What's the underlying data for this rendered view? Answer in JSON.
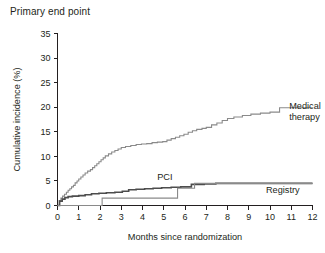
{
  "panel": {
    "title": "Primary end point"
  },
  "chart_data": {
    "type": "line",
    "title": "Primary end point",
    "xlabel": "Months since randomization",
    "ylabel": "Cumulative incidence (%)",
    "xlim": [
      0,
      12
    ],
    "ylim": [
      0,
      35
    ],
    "xticks": [
      "0",
      "1",
      "2",
      "3",
      "4",
      "5",
      "6",
      "7",
      "8",
      "9",
      "10",
      "11",
      "12"
    ],
    "yticks": [
      "0",
      "5",
      "10",
      "15",
      "20",
      "25",
      "30",
      "35"
    ],
    "grid": false,
    "legend_position": "inline-right",
    "annotations": [
      {
        "text": "Medical therapy",
        "x": 10.9,
        "y": 20.0
      },
      {
        "text": "PCI",
        "x": 5.05,
        "y": 5.6
      },
      {
        "text": "Registry",
        "x": 10.6,
        "y": 3.0
      }
    ],
    "series": [
      {
        "name": "Medical therapy",
        "color": "#8a8a8a",
        "width": 1.1,
        "step": "post",
        "points": [
          [
            0.0,
            0.0
          ],
          [
            0.08,
            1.0
          ],
          [
            0.16,
            1.5
          ],
          [
            0.24,
            1.9
          ],
          [
            0.33,
            2.3
          ],
          [
            0.42,
            2.7
          ],
          [
            0.5,
            3.1
          ],
          [
            0.58,
            3.4
          ],
          [
            0.66,
            3.8
          ],
          [
            0.75,
            4.1
          ],
          [
            0.83,
            4.6
          ],
          [
            0.92,
            5.0
          ],
          [
            1.0,
            5.4
          ],
          [
            1.1,
            5.8
          ],
          [
            1.2,
            6.2
          ],
          [
            1.3,
            6.6
          ],
          [
            1.42,
            7.0
          ],
          [
            1.55,
            7.3
          ],
          [
            1.65,
            7.7
          ],
          [
            1.75,
            8.1
          ],
          [
            1.85,
            8.5
          ],
          [
            1.95,
            8.9
          ],
          [
            2.05,
            9.3
          ],
          [
            2.15,
            9.7
          ],
          [
            2.25,
            10.1
          ],
          [
            2.4,
            10.5
          ],
          [
            2.55,
            10.9
          ],
          [
            2.7,
            11.2
          ],
          [
            2.85,
            11.5
          ],
          [
            3.0,
            11.8
          ],
          [
            3.2,
            12.0
          ],
          [
            3.45,
            12.2
          ],
          [
            3.7,
            12.4
          ],
          [
            3.95,
            12.5
          ],
          [
            4.2,
            12.6
          ],
          [
            4.45,
            12.8
          ],
          [
            4.7,
            12.9
          ],
          [
            4.95,
            13.0
          ],
          [
            5.15,
            13.3
          ],
          [
            5.35,
            13.6
          ],
          [
            5.55,
            13.9
          ],
          [
            5.75,
            14.2
          ],
          [
            5.95,
            14.5
          ],
          [
            6.15,
            14.9
          ],
          [
            6.35,
            15.2
          ],
          [
            6.55,
            15.5
          ],
          [
            6.8,
            15.7
          ],
          [
            7.0,
            15.9
          ],
          [
            7.25,
            16.4
          ],
          [
            7.5,
            16.8
          ],
          [
            7.75,
            17.3
          ],
          [
            8.0,
            17.7
          ],
          [
            8.3,
            18.0
          ],
          [
            8.7,
            18.3
          ],
          [
            9.1,
            18.6
          ],
          [
            9.55,
            18.8
          ],
          [
            10.0,
            19.0
          ],
          [
            10.45,
            19.9
          ],
          [
            12.0,
            19.9
          ]
        ]
      },
      {
        "name": "PCI",
        "color": "#4d4d4d",
        "width": 1.6,
        "step": "post",
        "points": [
          [
            0.0,
            0.0
          ],
          [
            0.1,
            0.9
          ],
          [
            0.22,
            1.3
          ],
          [
            0.35,
            1.6
          ],
          [
            0.5,
            1.8
          ],
          [
            0.7,
            1.9
          ],
          [
            1.0,
            2.0
          ],
          [
            1.3,
            2.2
          ],
          [
            1.6,
            2.4
          ],
          [
            1.95,
            2.5
          ],
          [
            2.3,
            2.6
          ],
          [
            2.7,
            2.7
          ],
          [
            3.05,
            2.9
          ],
          [
            3.35,
            3.2
          ],
          [
            3.7,
            3.3
          ],
          [
            4.1,
            3.4
          ],
          [
            4.5,
            3.5
          ],
          [
            4.9,
            3.6
          ],
          [
            5.35,
            3.7
          ],
          [
            5.8,
            3.8
          ],
          [
            6.3,
            4.3
          ],
          [
            6.9,
            4.4
          ],
          [
            7.45,
            4.5
          ],
          [
            12.0,
            4.5
          ]
        ]
      },
      {
        "name": "Registry",
        "color": "#8a8a8a",
        "width": 1.1,
        "step": "post",
        "points": [
          [
            0.0,
            0.0
          ],
          [
            2.1,
            0.0
          ],
          [
            2.1,
            1.5
          ],
          [
            5.65,
            1.5
          ],
          [
            5.65,
            3.5
          ],
          [
            6.45,
            3.5
          ],
          [
            6.45,
            4.5
          ],
          [
            12.0,
            4.5
          ]
        ]
      }
    ]
  }
}
